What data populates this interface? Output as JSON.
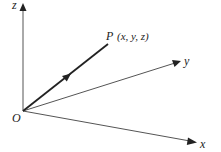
{
  "diagram": {
    "title": "",
    "type": "3D coordinate axes with position vector",
    "origin": {
      "label": "O",
      "x": 23,
      "y": 111
    },
    "axes": [
      {
        "name": "z",
        "label": "z",
        "end": [
          23,
          5
        ]
      },
      {
        "name": "y",
        "label": "y",
        "end": [
          181,
          61
        ]
      },
      {
        "name": "x",
        "label": "x",
        "end": [
          197,
          142
        ]
      }
    ],
    "point": {
      "label_name": "P",
      "label_coords": "(x, y, z)",
      "x": 108,
      "y": 44
    },
    "colors": {
      "axis": "#555555",
      "vector": "#222222",
      "text": "#222222",
      "background": "#ffffff"
    }
  }
}
